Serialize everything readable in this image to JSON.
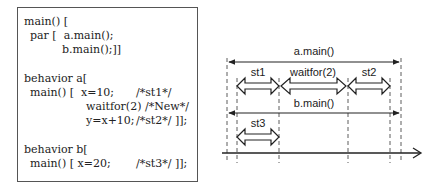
{
  "code": {
    "lines": [
      {
        "x": 6,
        "y": 7,
        "text": "main() ["
      },
      {
        "x": 12,
        "y": 21,
        "text": "par [  a.main();"
      },
      {
        "x": 44,
        "y": 35,
        "text": "b.main();]]"
      },
      {
        "x": 6,
        "y": 64,
        "text": "behavior a["
      },
      {
        "x": 12,
        "y": 78,
        "text": "main() [  x=10;"
      },
      {
        "x": 118,
        "y": 78,
        "text": "/*st1*/"
      },
      {
        "x": 68,
        "y": 92,
        "text": "waitfor(2) /*New*/"
      },
      {
        "x": 68,
        "y": 106,
        "text": "y=x+10;"
      },
      {
        "x": 118,
        "y": 106,
        "text": "/*st2*/ ]];"
      },
      {
        "x": 6,
        "y": 135,
        "text": "behavior b["
      },
      {
        "x": 12,
        "y": 149,
        "text": "main() [ x=20;"
      },
      {
        "x": 118,
        "y": 149,
        "text": "/*st3*/ ]];"
      }
    ]
  },
  "diagram": {
    "labels": {
      "a_main": "a.main()",
      "b_main": "b.main()",
      "st1": "st1",
      "waitfor": "waitfor(2)",
      "st2": "st2",
      "st3": "st3"
    },
    "colors": {
      "stroke": "#222222"
    }
  }
}
